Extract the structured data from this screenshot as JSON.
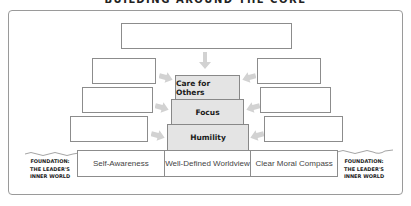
{
  "title": "BUILDING AROUND THE CORE",
  "pyramid": {
    "tiers": [
      {
        "label": "Care for Others"
      },
      {
        "label": "Focus"
      },
      {
        "label": "Humility"
      }
    ],
    "fill_color": "#e4e4e4"
  },
  "blank_boxes": {
    "top": {
      "text": ""
    },
    "left": [
      {
        "text": ""
      },
      {
        "text": ""
      },
      {
        "text": ""
      }
    ],
    "right": [
      {
        "text": ""
      },
      {
        "text": ""
      },
      {
        "text": ""
      }
    ]
  },
  "foundation": {
    "cells": [
      {
        "label": "Self-Awareness"
      },
      {
        "label": "Well-Defined Worldview"
      },
      {
        "label": "Clear Moral Compass"
      }
    ],
    "side_label_left": {
      "line1": "FOUNDATION:",
      "line2": "THE LEADER'S",
      "line3": "INNER WORLD"
    },
    "side_label_right": {
      "line1": "FOUNDATION:",
      "line2": "THE LEADER'S",
      "line3": "INNER WORLD"
    }
  },
  "icons": {
    "arrow_down": "↓",
    "arrow_right": "➔",
    "arrow_left": "⬅"
  },
  "colors": {
    "arrow": "#d2d2d2",
    "border": "#8c8c8c"
  }
}
